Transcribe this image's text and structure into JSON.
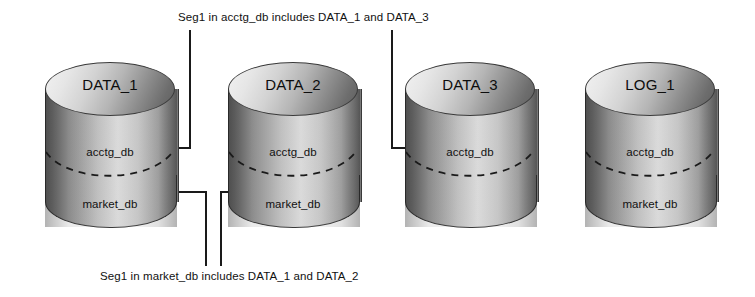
{
  "diagram": {
    "type": "database-segment-distribution",
    "annotations": {
      "top": "Seg1 in acctg_db includes DATA_1 and DATA_3",
      "bottom": "Seg1 in market_db includes DATA_1 and DATA_2"
    },
    "cylinders": [
      {
        "id": "cyl-data-1",
        "title": "DATA_1",
        "segments": [
          "acctg_db",
          "market_db"
        ],
        "x": 45
      },
      {
        "id": "cyl-data-2",
        "title": "DATA_2",
        "segments": [
          "acctg_db",
          "market_db"
        ],
        "x": 228
      },
      {
        "id": "cyl-data-3",
        "title": "DATA_3",
        "segments": [
          "acctg_db",
          ""
        ],
        "x": 405
      },
      {
        "id": "cyl-log-1",
        "title": "LOG_1",
        "segments": [
          "acctg_db",
          "market_db"
        ],
        "x": 585
      }
    ],
    "colors": {
      "outline": "#3a3a3a",
      "body_light": "#d6d6d6",
      "body_dark": "#6f6f6f",
      "text": "#111111",
      "wire": "#1a1a1a",
      "background": "#ffffff"
    }
  }
}
